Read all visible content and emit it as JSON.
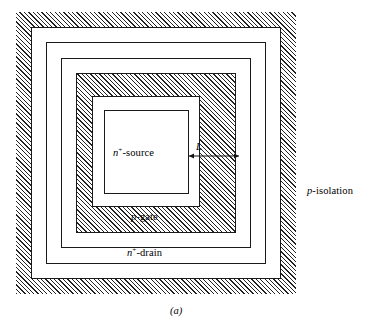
{
  "figure": {
    "caption": "(a)",
    "type": "semiconductor device top-view layout diagram"
  },
  "regions": [
    {
      "id": "p-isolation",
      "label_prefix": "p",
      "label_suffix": "-isolation",
      "fill": "hatched",
      "label_position": "right-outside"
    },
    {
      "id": "n-drain",
      "label_prefix": "n",
      "label_superscript": "+",
      "label_suffix": "-drain",
      "fill": "white",
      "label_position": "bottom-inside"
    },
    {
      "id": "p-gate",
      "label_prefix": "p",
      "label_suffix": "-gate",
      "fill": "hatched",
      "label_position": "bottom-inside"
    },
    {
      "id": "n-source",
      "label_prefix": "n",
      "label_superscript": "+",
      "label_suffix": "-source",
      "fill": "white",
      "label_position": "center"
    }
  ],
  "dimension": {
    "symbol": "L",
    "style": "double-headed-arrow",
    "spans": "p-gate width"
  },
  "colors": {
    "stroke": "#1a1a1a",
    "hatch": "#232323",
    "background": "#ffffff"
  }
}
